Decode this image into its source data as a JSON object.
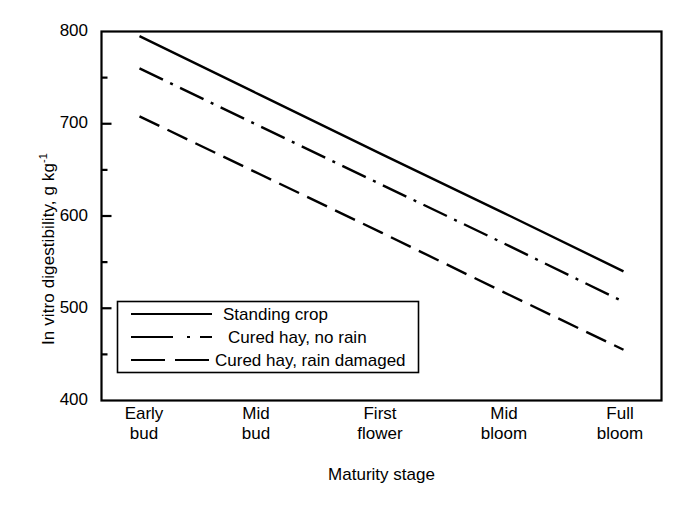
{
  "chart_data": {
    "type": "line",
    "title": "",
    "xlabel": "Maturity stage",
    "ylabel_main": "In vitro digestibility, g kg",
    "ylabel_sup": "-1",
    "categories": [
      "Early\nbud",
      "Mid\nbud",
      "First\nflower",
      "Mid\nbloom",
      "Full\nbloom"
    ],
    "category_lines": [
      [
        "Early",
        "bud"
      ],
      [
        "Mid",
        "bud"
      ],
      [
        "First",
        "flower"
      ],
      [
        "Mid",
        "bloom"
      ],
      [
        "Full",
        "bloom"
      ]
    ],
    "ylim": [
      400,
      800
    ],
    "ytick_labels": [
      "800",
      "700",
      "600",
      "500",
      "400"
    ],
    "ytick_values": [
      800,
      700,
      600,
      500,
      400
    ],
    "yminor_values": [
      750,
      650,
      550,
      450
    ],
    "grid": false,
    "legend_position": "lower left inside axes",
    "line_color": "#000000",
    "series": [
      {
        "name": "Standing crop",
        "style": "solid",
        "values": [
          795,
          731,
          667,
          604,
          540
        ]
      },
      {
        "name": "Cured hay, no rain",
        "style": "dashdot",
        "values": [
          760,
          697,
          634,
          571,
          507
        ]
      },
      {
        "name": "Cured hay, rain damaged",
        "style": "dashed",
        "values": [
          708,
          645,
          582,
          518,
          455
        ]
      }
    ]
  },
  "legend": {
    "items": [
      {
        "label": "Standing crop",
        "style": "solid"
      },
      {
        "label": "Cured hay, no rain",
        "style": "dashdot"
      },
      {
        "label": "Cured hay, rain damaged",
        "style": "dashed"
      }
    ]
  }
}
